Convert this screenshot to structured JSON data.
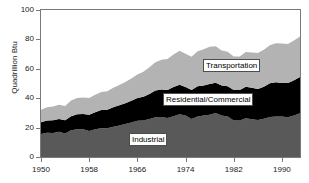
{
  "chart_data": {
    "type": "area",
    "stacked": true,
    "title": "",
    "xlabel": "",
    "ylabel": "Quadrillion Btu",
    "xlim": [
      1950,
      1993
    ],
    "ylim": [
      0,
      100
    ],
    "grid": false,
    "legend_position": "inline-annotations",
    "x": [
      1950,
      1951,
      1952,
      1953,
      1954,
      1955,
      1956,
      1957,
      1958,
      1959,
      1960,
      1961,
      1962,
      1963,
      1964,
      1965,
      1966,
      1967,
      1968,
      1969,
      1970,
      1971,
      1972,
      1973,
      1974,
      1975,
      1976,
      1977,
      1978,
      1979,
      1980,
      1981,
      1982,
      1983,
      1984,
      1985,
      1986,
      1987,
      1988,
      1989,
      1990,
      1991,
      1992,
      1993
    ],
    "series": [
      {
        "name": "Industrial",
        "color": "#595959",
        "values": [
          15.6,
          16.5,
          16.4,
          17.2,
          16.0,
          18.2,
          18.9,
          18.8,
          17.7,
          18.8,
          19.6,
          19.6,
          20.5,
          21.4,
          22.5,
          23.4,
          24.6,
          24.8,
          25.8,
          27.0,
          27.2,
          26.5,
          27.7,
          29.1,
          28.2,
          25.9,
          27.6,
          28.2,
          28.8,
          29.9,
          28.2,
          27.6,
          24.8,
          24.9,
          26.4,
          25.7,
          25.1,
          26.0,
          27.2,
          27.5,
          27.5,
          27.0,
          28.3,
          29.7
        ],
        "stack_order": 0
      },
      {
        "name": "Residential/Commercial",
        "color": "#000000",
        "values": [
          8.0,
          8.4,
          8.6,
          8.7,
          9.0,
          9.6,
          10.2,
          10.4,
          11.1,
          11.6,
          12.3,
          12.6,
          13.4,
          13.8,
          14.1,
          14.8,
          15.5,
          16.2,
          17.0,
          18.2,
          18.7,
          19.1,
          19.9,
          20.0,
          19.5,
          19.6,
          20.5,
          20.5,
          20.9,
          20.6,
          20.4,
          20.5,
          20.7,
          20.6,
          21.4,
          21.4,
          21.2,
          21.8,
          22.9,
          23.4,
          22.8,
          23.3,
          23.9,
          24.8
        ],
        "stack_order": 1
      },
      {
        "name": "Transportation",
        "color": "#b3b3b3",
        "values": [
          8.5,
          9.0,
          9.3,
          9.7,
          9.7,
          10.6,
          11.0,
          11.3,
          11.4,
          11.9,
          12.4,
          12.6,
          13.2,
          13.8,
          14.4,
          15.2,
          16.1,
          17.0,
          18.2,
          19.2,
          20.3,
          21.1,
          22.2,
          23.2,
          22.6,
          22.7,
          23.9,
          24.6,
          25.3,
          24.9,
          23.8,
          23.5,
          22.8,
          22.9,
          23.6,
          24.0,
          24.5,
          25.2,
          26.0,
          26.5,
          26.9,
          26.5,
          27.0,
          27.5
        ],
        "stack_order": 2
      }
    ],
    "stack_totals": [
      32.1,
      33.9,
      34.3,
      35.6,
      34.7,
      38.4,
      40.1,
      40.5,
      40.2,
      42.3,
      44.3,
      44.8,
      47.1,
      49.0,
      51.0,
      53.4,
      56.2,
      58.0,
      61.0,
      64.4,
      66.2,
      66.7,
      69.8,
      72.3,
      70.3,
      68.2,
      72.0,
      73.3,
      75.0,
      75.4,
      72.4,
      71.6,
      68.3,
      68.4,
      71.4,
      71.1,
      70.8,
      73.0,
      76.1,
      77.4,
      77.2,
      76.8,
      79.2,
      82.0
    ],
    "y_ticks": [
      {
        "value": 0,
        "label": "0"
      },
      {
        "value": 20,
        "label": "20"
      },
      {
        "value": 40,
        "label": "40"
      },
      {
        "value": 60,
        "label": "60"
      },
      {
        "value": 80,
        "label": "80"
      },
      {
        "value": 100,
        "label": "100"
      }
    ],
    "x_ticks": [
      {
        "value": 1950,
        "label": "1950"
      },
      {
        "value": 1958,
        "label": "1958"
      },
      {
        "value": 1966,
        "label": "1966"
      },
      {
        "value": 1974,
        "label": "1974"
      },
      {
        "value": 1982,
        "label": "1982"
      },
      {
        "value": 1990,
        "label": "1990"
      }
    ],
    "annotations": [
      {
        "text": "Transportation",
        "series": "Transportation"
      },
      {
        "text": "Residential/Commercial",
        "series": "Residential/Commercial"
      },
      {
        "text": "Industrial",
        "series": "Industrial"
      }
    ]
  },
  "axis": {
    "y_title": "Quadrillion Btu"
  },
  "labels": {
    "transportation": "Transportation",
    "residential_commercial": "Residential/Commercial",
    "industrial": "Industrial"
  },
  "colors": {
    "transportation": "#b3b3b3",
    "residential_commercial": "#000000",
    "industrial": "#595959",
    "axis": "#7a7a7a",
    "text": "#1a1a1a",
    "background": "#ffffff"
  }
}
